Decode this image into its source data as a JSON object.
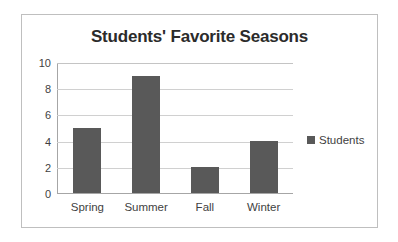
{
  "chart_data": {
    "type": "bar",
    "title": "Students' Favorite Seasons",
    "categories": [
      "Spring",
      "Summer",
      "Fall",
      "Winter"
    ],
    "values": [
      5,
      9,
      2,
      4
    ],
    "series": [
      {
        "name": "Students",
        "values": [
          5,
          9,
          2,
          4
        ]
      }
    ],
    "xlabel": "",
    "ylabel": "",
    "ylim": [
      0,
      10
    ],
    "yticks": [
      0,
      2,
      4,
      6,
      8,
      10
    ],
    "ytick_labels": [
      "0",
      "2",
      "4",
      "6",
      "8",
      "10"
    ],
    "grid": true,
    "legend": {
      "position": "right",
      "entries": [
        "Students"
      ]
    },
    "colors": {
      "bar": "#595959",
      "gridline": "#d0d0d0",
      "axis": "#a6a6a6",
      "frame": "#bfbfbf",
      "title_text": "#2b2b2b",
      "tick_text": "#3f3f3f",
      "background": "#ffffff"
    }
  }
}
